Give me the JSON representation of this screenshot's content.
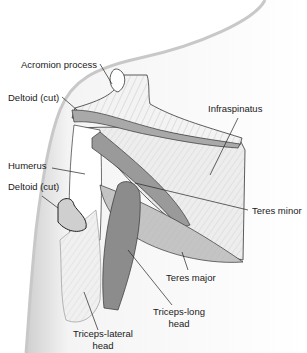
{
  "diagram": {
    "labels": {
      "acromion": "Acromion process",
      "deltoid_top": "Deltoid (cut)",
      "infraspinatus": "Infraspinatus",
      "humerus": "Humerus",
      "deltoid_bottom": "Deltoid (cut)",
      "teres_minor": "Teres minor",
      "teres_major": "Teres major",
      "triceps_long_1": "Triceps-long",
      "triceps_long_2": "head",
      "triceps_lateral_1": "Triceps-lateral",
      "triceps_lateral_2": "head"
    },
    "colors": {
      "skin_shadow": "#d9d9d9",
      "muscle_light": "#e6e6e6",
      "muscle_mid": "#bdbdbd",
      "muscle_dark": "#8a8a8a",
      "outline": "#333333",
      "leader": "#222222"
    }
  }
}
